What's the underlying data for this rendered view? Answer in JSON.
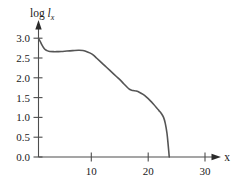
{
  "chart_data": {
    "type": "line",
    "title": "",
    "subtitle": "",
    "ylabel": "log l_x",
    "ylabel_parts": {
      "prefix": "log ",
      "symbol": "l",
      "subscript": "x"
    },
    "xlabel": "x",
    "xlim": [
      0,
      32.5
    ],
    "ylim": [
      0.0,
      3.2
    ],
    "xticks": [
      10,
      20,
      30
    ],
    "xtick_labels": [
      "10",
      "20",
      "30"
    ],
    "yticks": [
      0.0,
      0.5,
      1.0,
      1.5,
      2.0,
      2.5,
      3.0
    ],
    "ytick_labels": [
      "0.0",
      "0.5",
      "1.0",
      "1.5",
      "2.0",
      "2.5",
      "3.0"
    ],
    "grid": false,
    "legend": false,
    "axis_style": "arrowed-open",
    "tick_direction": "out",
    "series": [
      {
        "name": "log survivorship",
        "color": "#555555",
        "x": [
          0.0,
          0.3,
          0.6,
          0.9,
          1.2,
          1.6,
          2.0,
          2.6,
          3.2,
          4.0,
          5.0,
          6.0,
          7.0,
          7.8,
          8.4,
          9.0,
          9.6,
          10.2,
          10.8,
          11.4,
          12.0,
          12.6,
          13.2,
          13.8,
          14.4,
          15.0,
          15.6,
          16.0,
          16.4,
          16.8,
          17.2,
          17.8,
          18.4,
          19.0,
          19.6,
          20.2,
          20.8,
          21.2,
          21.6,
          22.0,
          22.3,
          22.6,
          22.8,
          23.0
        ],
        "y": [
          3.0,
          2.92,
          2.83,
          2.76,
          2.71,
          2.68,
          2.665,
          2.66,
          2.66,
          2.665,
          2.675,
          2.685,
          2.695,
          2.69,
          2.665,
          2.63,
          2.58,
          2.5,
          2.42,
          2.34,
          2.26,
          2.18,
          2.1,
          2.02,
          1.94,
          1.85,
          1.76,
          1.71,
          1.685,
          1.675,
          1.665,
          1.63,
          1.58,
          1.51,
          1.43,
          1.34,
          1.24,
          1.17,
          1.1,
          1.0,
          0.85,
          0.6,
          0.32,
          0.0
        ]
      }
    ],
    "annotations": []
  }
}
